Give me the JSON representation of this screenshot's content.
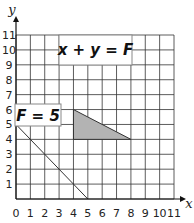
{
  "chart_data": {
    "type": "line",
    "title": "",
    "xlabel": "x",
    "ylabel": "y",
    "xlim": [
      0,
      11
    ],
    "ylim": [
      0,
      11
    ],
    "grid": true,
    "x_ticks": [
      "0",
      "1",
      "2",
      "3",
      "4",
      "5",
      "6",
      "7",
      "8",
      "9",
      "10",
      "11"
    ],
    "y_ticks": [
      "1",
      "2",
      "3",
      "4",
      "5",
      "6",
      "7",
      "8",
      "9",
      "10",
      "11"
    ],
    "annotations": [
      {
        "text": "x + y = F",
        "position": "top-center",
        "boxed": true
      },
      {
        "text": "F = 5",
        "position": "left, near y=5.5",
        "boxed": true
      }
    ],
    "series": [
      {
        "name": "F = 5",
        "type": "line",
        "points": [
          [
            0,
            5
          ],
          [
            5,
            0
          ]
        ]
      }
    ],
    "shaded_region": {
      "name": "feasible-region",
      "shape": "triangle",
      "vertices": [
        [
          4,
          6
        ],
        [
          4,
          4
        ],
        [
          8,
          4
        ]
      ],
      "fill": "#b3b3b3"
    }
  },
  "labels": {
    "equation": "x + y = F",
    "level": "F = 5",
    "x_axis": "x",
    "y_axis": "y"
  }
}
